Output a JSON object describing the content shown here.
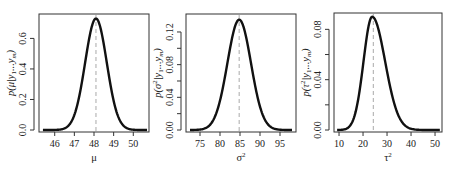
{
  "chart_data": [
    {
      "type": "line",
      "title": "",
      "xlabel": "μ",
      "ylabel": "p(μ|y1...ym)",
      "ylabel_parts": {
        "pre": "p(μ|y",
        "sub1": "1",
        "mid": "...y",
        "sub2": "m",
        "post": ")"
      },
      "xlim": [
        45.2,
        50.8
      ],
      "ylim": [
        0,
        0.76
      ],
      "x_ticks": [
        46,
        47,
        48,
        49,
        50
      ],
      "x_tick_labels": [
        "46",
        "47",
        "48",
        "49",
        "50"
      ],
      "y_ticks": [
        0.0,
        0.2,
        0.4,
        0.6
      ],
      "y_tick_labels": [
        "0.0",
        "0.2",
        "0.4",
        "0.6"
      ],
      "y_minor_ticks": [],
      "grid": false,
      "legend": null,
      "curve": {
        "shape": "normal",
        "mode": 48.1,
        "peak": 0.73,
        "sd": 0.55
      },
      "dashed_vline": 48.1,
      "x_range_drawn": [
        45.4,
        50.7
      ],
      "box": {
        "x0": 39,
        "x1": 149,
        "y0": 14,
        "y1": 132
      }
    },
    {
      "type": "line",
      "title": "",
      "xlabel": "σ²",
      "ylabel": "p(σ²|y1...ym)",
      "ylabel_parts": {
        "pre": "p(σ",
        "sup": "2",
        "mid": "|y",
        "sub1": "1",
        "mid2": "...y",
        "sub2": "m",
        "post": ")"
      },
      "xlim": [
        71.5,
        99
      ],
      "ylim": [
        0,
        0.142
      ],
      "x_ticks": [
        75,
        80,
        85,
        90,
        95
      ],
      "x_tick_labels": [
        "75",
        "80",
        "85",
        "90",
        "95"
      ],
      "y_ticks": [
        0.0,
        0.04,
        0.08,
        0.12
      ],
      "y_tick_labels": [
        "0.00",
        "0.04",
        "0.08",
        "0.12"
      ],
      "y_minor_ticks": [
        0.02,
        0.06,
        0.1
      ],
      "grid": false,
      "legend": null,
      "curve": {
        "shape": "normal",
        "mode": 84.8,
        "peak": 0.135,
        "sd": 2.95
      },
      "dashed_vline": 84.8,
      "x_range_drawn": [
        72.5,
        98
      ],
      "box": {
        "x0": 186,
        "x1": 296,
        "y0": 14,
        "y1": 132
      }
    },
    {
      "type": "line",
      "title": "",
      "xlabel": "τ²",
      "ylabel": "p(τ²|y1...ym)",
      "ylabel_parts": {
        "pre": "p(τ",
        "sup": "2",
        "mid": "|y",
        "sub1": "1",
        "mid2": "...y",
        "sub2": "m",
        "post": ")"
      },
      "xlim": [
        7.9,
        52.9
      ],
      "ylim": [
        0,
        0.093
      ],
      "x_ticks": [
        10,
        20,
        30,
        40,
        50
      ],
      "x_tick_labels": [
        "10",
        "20",
        "30",
        "40",
        "50"
      ],
      "y_ticks": [
        0.0,
        0.04,
        0.08
      ],
      "y_tick_labels": [
        "0.00",
        "0.04",
        "0.08"
      ],
      "y_minor_ticks": [
        0.02,
        0.06
      ],
      "grid": false,
      "legend": null,
      "curve": {
        "shape": "right-skewed",
        "mode": 23.8,
        "peak": 0.09,
        "sd_left": 3.6,
        "sd_right": 5.4
      },
      "dashed_vline": 24.3,
      "x_range_drawn": [
        9.2,
        52
      ],
      "box": {
        "x0": 334,
        "x1": 442,
        "y0": 13,
        "y1": 132
      }
    }
  ],
  "colors": {
    "curve": "#111111",
    "axis": "#333333",
    "dashed_line": "#b8b8b8",
    "background": "#ffffff"
  }
}
